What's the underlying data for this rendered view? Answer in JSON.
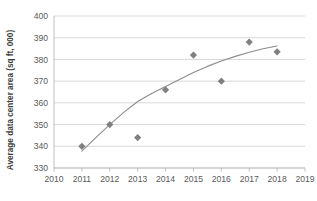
{
  "chart_data": {
    "type": "scatter",
    "title": "",
    "xlabel": "",
    "ylabel": "Average data center area (sq ft, 000)",
    "xlim": [
      2010,
      2019
    ],
    "ylim": [
      330,
      400
    ],
    "grid": true,
    "legend": false,
    "x_ticks": [
      "2010",
      "2011",
      "2012",
      "2013",
      "2014",
      "2015",
      "2016",
      "2017",
      "2018",
      "2019"
    ],
    "y_ticks": [
      "330",
      "340",
      "350",
      "360",
      "370",
      "380",
      "390",
      "400"
    ],
    "x": [
      2011,
      2012,
      2013,
      2014,
      2015,
      2016,
      2017,
      2018
    ],
    "values": [
      340,
      350,
      344,
      366,
      382,
      370,
      388,
      383.5
    ],
    "series": [
      {
        "name": "Average data center area",
        "marker": "diamond",
        "color": "#808080",
        "points": [
          {
            "x": 2011,
            "y": 340
          },
          {
            "x": 2012,
            "y": 350
          },
          {
            "x": 2013,
            "y": 344
          },
          {
            "x": 2014,
            "y": 366
          },
          {
            "x": 2015,
            "y": 382
          },
          {
            "x": 2016,
            "y": 370
          },
          {
            "x": 2017,
            "y": 388
          },
          {
            "x": 2018,
            "y": 383.5
          }
        ]
      },
      {
        "name": "Trendline",
        "type": "line",
        "color": "#8c8c8c",
        "points": [
          {
            "x": 2011.0,
            "y": 337.8
          },
          {
            "x": 2011.5,
            "y": 344.0
          },
          {
            "x": 2012.0,
            "y": 350.0
          },
          {
            "x": 2012.5,
            "y": 355.6
          },
          {
            "x": 2013.0,
            "y": 360.6
          },
          {
            "x": 2013.5,
            "y": 364.3
          },
          {
            "x": 2014.0,
            "y": 367.5
          },
          {
            "x": 2014.5,
            "y": 370.8
          },
          {
            "x": 2015.0,
            "y": 374.0
          },
          {
            "x": 2015.5,
            "y": 376.8
          },
          {
            "x": 2016.0,
            "y": 379.3
          },
          {
            "x": 2016.5,
            "y": 381.4
          },
          {
            "x": 2017.0,
            "y": 383.3
          },
          {
            "x": 2017.5,
            "y": 384.9
          },
          {
            "x": 2018.0,
            "y": 386.2
          }
        ]
      }
    ],
    "colors": {
      "marker": "#808080",
      "trendline": "#8c8c8c",
      "grid": "#d9d9d9",
      "axis": "#bfbfbf",
      "tick_label": "#5a5a5a",
      "axis_title": "#3d3d3d",
      "background": "#ffffff"
    }
  }
}
